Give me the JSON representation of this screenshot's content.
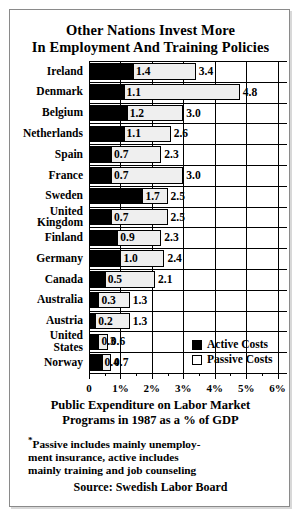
{
  "title": {
    "line1": "Other Nations Invest More",
    "line2": "In Employment And Training Policies"
  },
  "axis_caption": {
    "line1": "Public Expenditure on Labor Market",
    "line2": "Programs in 1987 as a % of GDP"
  },
  "footnote": {
    "marker": "*",
    "line1": "Passive includes mainly unemploy-",
    "line2": "ment insurance, active includes",
    "line3": "mainly training and job counseling"
  },
  "source": "Source:  Swedish Labor Board",
  "legend": {
    "active_label": "Active Costs",
    "passive_label": "Passive Costs",
    "active_color": "#000000",
    "passive_color": "#ffffff"
  },
  "chart_data": {
    "type": "bar",
    "orientation": "horizontal",
    "stacked": true,
    "title": "Other Nations Invest More In Employment And Training Policies",
    "xlabel": "Public Expenditure on Labor Market Programs in 1987 as a % of GDP",
    "ylabel": "",
    "xlim": [
      0,
      6.3
    ],
    "xticks": [
      0,
      1,
      2,
      3,
      4,
      5,
      6
    ],
    "xticklabels": [
      "0",
      "1%",
      "2%",
      "3%",
      "4%",
      "5%",
      "6%"
    ],
    "minor_tick_step": 0.5,
    "grid": true,
    "legend_position": "inside-bottom-right",
    "categories": [
      "Ireland",
      "Denmark",
      "Belgium",
      "Netherlands",
      "Spain",
      "France",
      "Sweden",
      "United Kingdom",
      "Finland",
      "Germany",
      "Canada",
      "Australia",
      "Austria",
      "United States",
      "Norway"
    ],
    "series": [
      {
        "name": "Active Costs",
        "color": "#000000",
        "values": [
          1.4,
          1.1,
          1.2,
          1.1,
          0.7,
          0.7,
          1.7,
          0.7,
          0.9,
          1.0,
          0.5,
          0.3,
          0.2,
          0.3,
          0.4
        ]
      },
      {
        "name": "Passive Costs",
        "color": "#efefef",
        "values": [
          3.4,
          4.8,
          3.0,
          2.6,
          2.3,
          3.0,
          2.5,
          2.5,
          2.3,
          2.4,
          2.1,
          1.3,
          1.3,
          0.6,
          0.7
        ]
      }
    ],
    "rows": [
      {
        "label": "Ireland",
        "label_lines": [
          "Ireland"
        ],
        "active": 1.4,
        "passive": 3.4,
        "active_text": "1.4",
        "passive_text": "3.4"
      },
      {
        "label": "Denmark",
        "label_lines": [
          "Denmark"
        ],
        "active": 1.1,
        "passive": 4.8,
        "active_text": "1.1",
        "passive_text": "4.8"
      },
      {
        "label": "Belgium",
        "label_lines": [
          "Belgium"
        ],
        "active": 1.2,
        "passive": 3.0,
        "active_text": "1.2",
        "passive_text": "3.0"
      },
      {
        "label": "Netherlands",
        "label_lines": [
          "Netherlands"
        ],
        "active": 1.1,
        "passive": 2.6,
        "active_text": "1.1",
        "passive_text": "2.6"
      },
      {
        "label": "Spain",
        "label_lines": [
          "Spain"
        ],
        "active": 0.7,
        "passive": 2.3,
        "active_text": "0.7",
        "passive_text": "2.3"
      },
      {
        "label": "France",
        "label_lines": [
          "France"
        ],
        "active": 0.7,
        "passive": 3.0,
        "active_text": "0.7",
        "passive_text": "3.0"
      },
      {
        "label": "Sweden",
        "label_lines": [
          "Sweden"
        ],
        "active": 1.7,
        "passive": 2.5,
        "active_text": "1.7",
        "passive_text": "2.5"
      },
      {
        "label": "United Kingdom",
        "label_lines": [
          "United",
          "Kingdom"
        ],
        "active": 0.7,
        "passive": 2.5,
        "active_text": "0.7",
        "passive_text": "2.5"
      },
      {
        "label": "Finland",
        "label_lines": [
          "Finland"
        ],
        "active": 0.9,
        "passive": 2.3,
        "active_text": "0.9",
        "passive_text": "2.3"
      },
      {
        "label": "Germany",
        "label_lines": [
          "Germany"
        ],
        "active": 1.0,
        "passive": 2.4,
        "active_text": "1.0",
        "passive_text": "2.4"
      },
      {
        "label": "Canada",
        "label_lines": [
          "Canada"
        ],
        "active": 0.5,
        "passive": 2.1,
        "active_text": "0.5",
        "passive_text": "2.1"
      },
      {
        "label": "Australia",
        "label_lines": [
          "Australia"
        ],
        "active": 0.3,
        "passive": 1.3,
        "active_text": "0.3",
        "passive_text": "1.3"
      },
      {
        "label": "Austria",
        "label_lines": [
          "Austria"
        ],
        "active": 0.2,
        "passive": 1.3,
        "active_text": "0.2",
        "passive_text": "1.3"
      },
      {
        "label": "United States",
        "label_lines": [
          "United",
          "States"
        ],
        "active": 0.3,
        "passive": 0.6,
        "active_text": "0.3",
        "passive_text": "0.6"
      },
      {
        "label": "Norway",
        "label_lines": [
          "Norway"
        ],
        "active": 0.4,
        "passive": 0.7,
        "active_text": "0.4",
        "passive_text": "0.7"
      }
    ]
  }
}
